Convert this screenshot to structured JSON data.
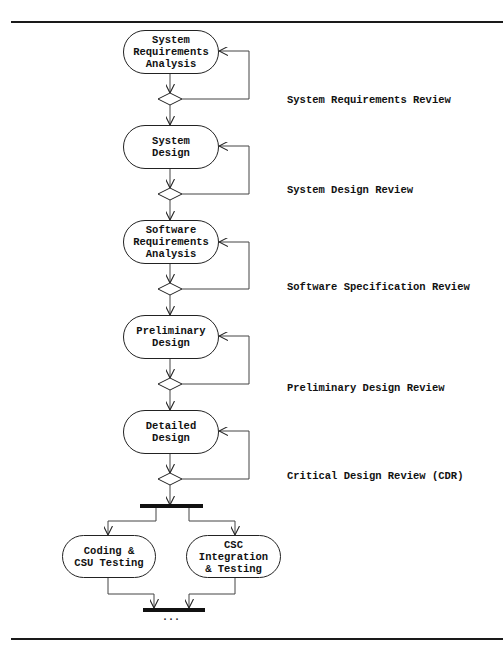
{
  "diagram": {
    "type": "activity-diagram",
    "activities": [
      {
        "id": "sra",
        "lines": [
          "System",
          "Requirements",
          "Analysis"
        ]
      },
      {
        "id": "sd",
        "lines": [
          "System",
          "Design"
        ]
      },
      {
        "id": "swra",
        "lines": [
          "Software",
          "Requirements",
          "Analysis"
        ]
      },
      {
        "id": "pd",
        "lines": [
          "Preliminary",
          "Design"
        ]
      },
      {
        "id": "dd",
        "lines": [
          "Detailed",
          "Design"
        ]
      },
      {
        "id": "code",
        "lines": [
          "Coding &",
          "CSU Testing"
        ]
      },
      {
        "id": "csc",
        "lines": [
          "CSC",
          "Integration",
          "& Testing"
        ]
      }
    ],
    "reviews": [
      "System Requirements Review",
      "System Design Review",
      "Software Specification Review",
      "Preliminary Design Review",
      "Critical Design Review (CDR)"
    ],
    "continuation": "...",
    "edges": [
      {
        "from": "sra",
        "to": "decision-1"
      },
      {
        "from": "decision-1",
        "to": "sra",
        "label": "loop back"
      },
      {
        "from": "decision-1",
        "to": "sd"
      },
      {
        "from": "sd",
        "to": "decision-2"
      },
      {
        "from": "decision-2",
        "to": "sd",
        "label": "loop back"
      },
      {
        "from": "decision-2",
        "to": "swra"
      },
      {
        "from": "swra",
        "to": "decision-3"
      },
      {
        "from": "decision-3",
        "to": "swra",
        "label": "loop back"
      },
      {
        "from": "decision-3",
        "to": "pd"
      },
      {
        "from": "pd",
        "to": "decision-4"
      },
      {
        "from": "decision-4",
        "to": "pd",
        "label": "loop back"
      },
      {
        "from": "decision-4",
        "to": "dd"
      },
      {
        "from": "dd",
        "to": "decision-5"
      },
      {
        "from": "decision-5",
        "to": "dd",
        "label": "loop back"
      },
      {
        "from": "decision-5",
        "to": "fork"
      },
      {
        "from": "fork",
        "to": "code"
      },
      {
        "from": "fork",
        "to": "csc"
      },
      {
        "from": "code",
        "to": "join"
      },
      {
        "from": "csc",
        "to": "join"
      }
    ]
  }
}
